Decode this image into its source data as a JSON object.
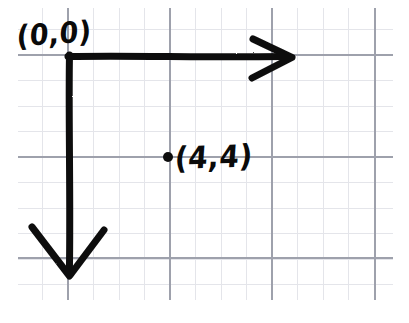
{
  "figure": {
    "kind": "hand-drawn-coordinate-diagram",
    "medium": "graph-paper",
    "width": 409,
    "height": 323
  },
  "paper": {
    "background_color": "#ffffff",
    "minor_grid_color": "#e2e3e8",
    "major_grid_color": "#9a9da8",
    "minor_spacing_px": 25.5,
    "major_spacing_px": 102,
    "grid_left_px": 18,
    "grid_right_px": 393,
    "grid_top_px": 8,
    "grid_bottom_px": 300,
    "major_vertical_x": [
      68,
      170,
      272,
      375
    ],
    "major_horizontal_y": [
      55,
      157,
      258
    ]
  },
  "ink": {
    "color": "#0d0d0d",
    "stroke_width_px": 7
  },
  "axes": {
    "origin": {
      "x": 68,
      "y": 55
    },
    "horizontal": {
      "name": "x-axis",
      "direction": "right",
      "from_x": 68,
      "to_x": 292,
      "y": 56,
      "arrowhead": "open-chevron"
    },
    "vertical": {
      "name": "y-axis",
      "direction": "down",
      "x": 69,
      "from_y": 55,
      "to_y": 276,
      "arrowhead": "open-chevron"
    }
  },
  "labels": {
    "origin": "(0,0)",
    "point": "(4,4)"
  },
  "points": [
    {
      "name": "plotted-point",
      "label": "(4,4)",
      "marker": "filled-dot",
      "x": 168,
      "y": 157,
      "radius_px": 5
    }
  ]
}
